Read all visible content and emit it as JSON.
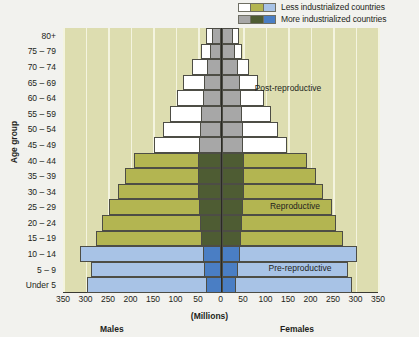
{
  "legend": {
    "items": [
      {
        "label": "Less industrialized countries",
        "colors": [
          "#ffffff",
          "#b3b551",
          "#a8c3e6"
        ]
      },
      {
        "label": "More industrialized countries",
        "colors": [
          "#a7a7a7",
          "#4e5c33",
          "#4a7ec4"
        ]
      }
    ]
  },
  "axes": {
    "y_title": "Age group",
    "x_unit": "(Millions)",
    "males_label": "Males",
    "females_label": "Females"
  },
  "annotations": [
    {
      "text": "Post-reproductive",
      "x": 288,
      "y": 88
    },
    {
      "text": "Reproductive",
      "x": 295,
      "y": 206
    },
    {
      "text": "Pre-reproductive",
      "x": 300,
      "y": 268
    }
  ],
  "chart_data": {
    "type": "bar",
    "subtype": "population-pyramid",
    "title": "",
    "xlabel": "(Millions)",
    "ylabel": "Age group",
    "xlim": [
      -350,
      350
    ],
    "xticks": [
      -350,
      -300,
      -250,
      -200,
      -150,
      -100,
      -50,
      0,
      50,
      100,
      150,
      200,
      250,
      300,
      350
    ],
    "xticklabels": [
      "350",
      "300",
      "250",
      "200",
      "150",
      "100",
      "50",
      "0",
      "50",
      "100",
      "150",
      "200",
      "250",
      "300",
      "350"
    ],
    "grid": true,
    "legend_position": "top-right",
    "categories": [
      "Under 5",
      "5 – 9",
      "10 – 14",
      "15 – 19",
      "20 – 24",
      "25 – 29",
      "30 – 34",
      "35 – 39",
      "40 – 44",
      "45 – 49",
      "50 – 54",
      "55 – 59",
      "60 – 64",
      "65 – 69",
      "70 – 74",
      "75 – 79",
      "80+"
    ],
    "stage_groups": [
      {
        "name": "Pre-reproductive",
        "categories": [
          "Under 5",
          "5 – 9",
          "10 – 14"
        ],
        "color_less": "#a8c3e6",
        "color_more": "#4a7ec4"
      },
      {
        "name": "Reproductive",
        "categories": [
          "15 – 19",
          "20 – 24",
          "25 – 29",
          "30 – 34",
          "35 – 39",
          "40 – 44"
        ],
        "color_less": "#b3b551",
        "color_more": "#4e5c33"
      },
      {
        "name": "Post-reproductive",
        "categories": [
          "45 – 49",
          "50 – 54",
          "55 – 59",
          "60 – 64",
          "65 – 69",
          "70 – 74",
          "75 – 79",
          "80+"
        ],
        "color_less": "#ffffff",
        "color_more": "#a7a7a7"
      }
    ],
    "series": [
      {
        "name": "Less industrialized countries",
        "sex": "Males",
        "values": [
          -300,
          -290,
          -315,
          -280,
          -265,
          -250,
          -230,
          -215,
          -195,
          -150,
          -130,
          -115,
          -100,
          -85,
          -65,
          -45,
          -35
        ]
      },
      {
        "name": "Less industrialized countries",
        "sex": "Females",
        "values": [
          290,
          280,
          300,
          270,
          255,
          245,
          225,
          210,
          190,
          145,
          125,
          110,
          95,
          80,
          62,
          45,
          38
        ]
      },
      {
        "name": "More industrialized countries",
        "sex": "Males",
        "values": [
          -35,
          -38,
          -42,
          -45,
          -48,
          -50,
          -52,
          -52,
          -52,
          -50,
          -48,
          -45,
          -42,
          -38,
          -33,
          -26,
          -22
        ]
      },
      {
        "name": "More industrialized countries",
        "sex": "Females",
        "values": [
          33,
          36,
          40,
          43,
          46,
          48,
          50,
          50,
          50,
          48,
          47,
          45,
          43,
          40,
          36,
          30,
          26
        ]
      }
    ]
  }
}
